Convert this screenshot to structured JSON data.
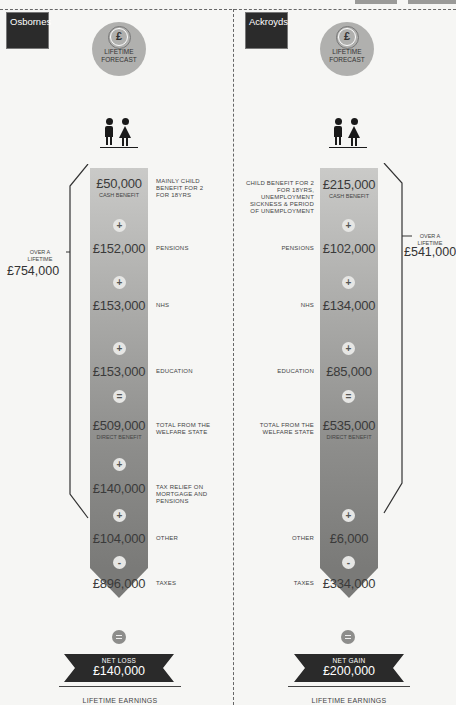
{
  "forecast_label": "LIFETIME FORECAST",
  "forecast_icon": "pound-coin-icon",
  "families": [
    {
      "name": "Osbornes",
      "items": [
        {
          "amount": "£50,000",
          "sub": "CASH BENEFIT",
          "note": "MAINLY CHILD BENEFIT FOR 2 FOR 18YRS"
        },
        {
          "op": "+",
          "amount": "£152,000",
          "note": "PENSIONS"
        },
        {
          "op": "+",
          "amount": "£153,000",
          "note": "NHS"
        },
        {
          "op": "+",
          "amount": "£153,000",
          "note": "EDUCATION"
        },
        {
          "op": "=",
          "amount": "£509,000",
          "sub": "DIRECT BENEFIT",
          "note": "TOTAL FROM THE WELFARE STATE"
        },
        {
          "op": "+",
          "amount": "£140,000",
          "note": "TAX RELIEF ON MORTGAGE AND PENSIONS"
        },
        {
          "op": "+",
          "amount": "£104,000",
          "note": "OTHER"
        },
        {
          "op": "-",
          "amount": "£896,000",
          "note": "TAXES"
        }
      ],
      "lifetime_label": "OVER A LIFETIME",
      "lifetime_total": "£754,000",
      "result_label": "NET LOSS",
      "result_value": "£140,000",
      "footer": "LIFETIME EARNINGS"
    },
    {
      "name": "Ackroyds",
      "items": [
        {
          "amount": "£215,000",
          "sub": "CASH BENEFIT",
          "note": "CHILD BENEFIT FOR 2 FOR 18YRS, UNEMPLOYMENT SICKNESS & PERIOD OF UNEMPLOYMENT"
        },
        {
          "op": "+",
          "amount": "£102,000",
          "note": "PENSIONS"
        },
        {
          "op": "+",
          "amount": "£134,000",
          "note": "NHS"
        },
        {
          "op": "+",
          "amount": "£85,000",
          "note": "EDUCATION"
        },
        {
          "op": "=",
          "amount": "£535,000",
          "sub": "DIRECT BENEFIT",
          "note": "TOTAL FROM THE WELFARE STATE"
        },
        {
          "op": "+",
          "amount": "£6,000",
          "note": "OTHER"
        },
        {
          "op": "-",
          "amount": "£334,000",
          "note": "TAXES"
        }
      ],
      "lifetime_label": "OVER A LIFETIME",
      "lifetime_total": "£541,000",
      "result_label": "NET GAIN",
      "result_value": "£200,000",
      "footer": "LIFETIME EARNINGS"
    }
  ],
  "colors": {
    "background": "#f6f6f4",
    "bar_top": "#cacac8",
    "bar_bottom": "#7a7a78",
    "banner": "#2a2a2a",
    "tag": "#2b2b2b"
  }
}
